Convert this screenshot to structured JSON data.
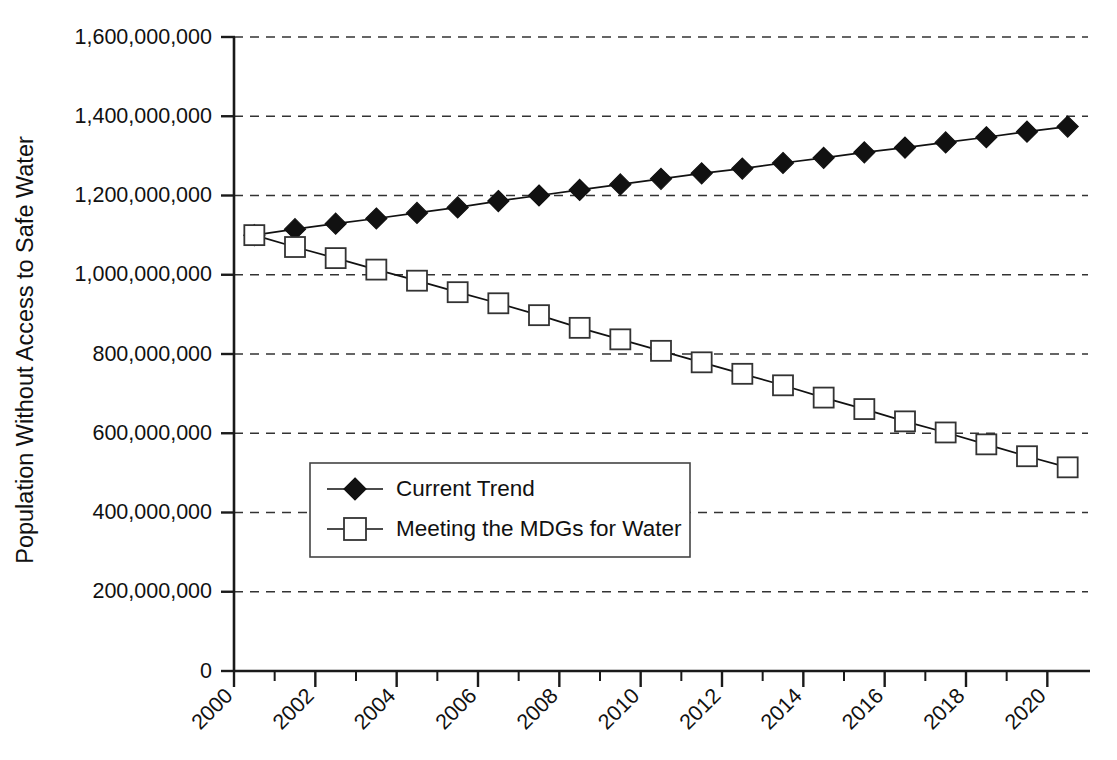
{
  "chart_data": {
    "type": "line",
    "title": "",
    "xlabel": "",
    "ylabel": "Population Without Access to Safe Water",
    "xlim": [
      2000,
      2021
    ],
    "ylim": [
      0,
      1600000000
    ],
    "grid": true,
    "legend_position": "center-left-inside",
    "x_tick_labels": [
      "2000",
      "2002",
      "2004",
      "2006",
      "2008",
      "2010",
      "2012",
      "2014",
      "2016",
      "2018",
      "2020"
    ],
    "x_tick_values": [
      2000,
      2002,
      2004,
      2006,
      2008,
      2010,
      2012,
      2014,
      2016,
      2018,
      2020
    ],
    "x_minor_tick_values": [
      2001,
      2003,
      2005,
      2007,
      2009,
      2011,
      2013,
      2015,
      2017,
      2019
    ],
    "y_tick_labels": [
      "0",
      "200,000,000",
      "400,000,000",
      "600,000,000",
      "800,000,000",
      "1,000,000,000",
      "1,200,000,000",
      "1,400,000,000",
      "1,600,000,000"
    ],
    "y_tick_values": [
      0,
      200000000,
      400000000,
      600000000,
      800000000,
      1000000000,
      1200000000,
      1400000000,
      1600000000
    ],
    "x": [
      2000.5,
      2001.5,
      2002.5,
      2003.5,
      2004.5,
      2005.5,
      2006.5,
      2007.5,
      2008.5,
      2009.5,
      2010.5,
      2011.5,
      2012.5,
      2013.5,
      2014.5,
      2015.5,
      2016.5,
      2017.5,
      2018.5,
      2019.5,
      2020.5
    ],
    "series": [
      {
        "name": "Current Trend",
        "marker": "filled-diamond",
        "values": [
          1100000000,
          1115000000,
          1129000000,
          1142000000,
          1156000000,
          1170000000,
          1186000000,
          1200000000,
          1214000000,
          1228000000,
          1242000000,
          1256000000,
          1268000000,
          1282000000,
          1295000000,
          1309000000,
          1321000000,
          1334000000,
          1347000000,
          1361000000,
          1374000000
        ]
      },
      {
        "name": "Meeting the MDGs for Water",
        "marker": "open-square",
        "values": [
          1100000000,
          1070000000,
          1042000000,
          1013000000,
          985000000,
          956000000,
          928000000,
          898000000,
          866000000,
          837000000,
          808000000,
          779000000,
          750000000,
          721000000,
          690000000,
          661000000,
          630000000,
          602000000,
          572000000,
          542000000,
          514000000
        ]
      }
    ]
  },
  "legend": {
    "items": [
      {
        "label": "Current Trend"
      },
      {
        "label": "Meeting the MDGs for Water"
      }
    ]
  }
}
